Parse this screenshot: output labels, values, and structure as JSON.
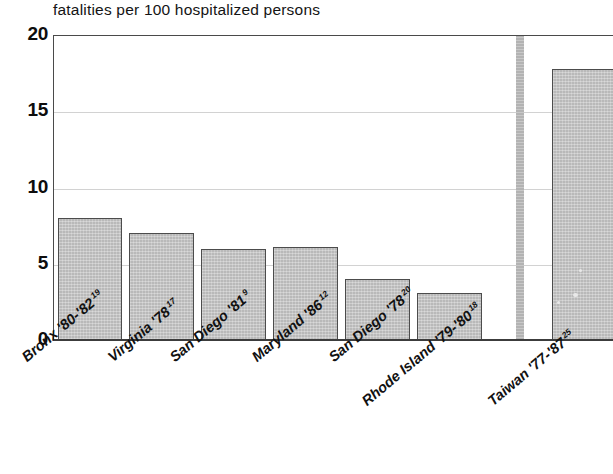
{
  "chart_data": {
    "type": "bar",
    "title": "fatalities per 100 hospitalized persons",
    "xlabel": "",
    "ylabel": "",
    "ylim": [
      0,
      20
    ],
    "yticks": [
      "0",
      "5",
      "10",
      "15",
      "20"
    ],
    "ytick_values": [
      0,
      5,
      10,
      15,
      20
    ],
    "grid": "horizontal",
    "legend": "none",
    "categories": [
      "Bronx '80-'82",
      "Virginia '78",
      "San Diego '81",
      "Maryland '86",
      "San Diego '78",
      "Rhode Island '79-'80",
      "Taiwan '77-'87"
    ],
    "reference_marks": [
      "19",
      "17",
      "9",
      "12",
      "20",
      "18",
      "25"
    ],
    "values": [
      8.0,
      7.0,
      6.0,
      6.1,
      4.0,
      3.1,
      17.8
    ],
    "bar_color": "#b9b9b9",
    "bar_edge_color": "#4c4c4c",
    "separator_note": "vertical gray band separating the last category from the rest"
  },
  "bars": [
    {
      "label": "Bronx '80-'82",
      "ref": "19",
      "value": 8.0,
      "x": 57,
      "w": 64
    },
    {
      "label": "Virginia '78",
      "ref": "17",
      "value": 7.0,
      "x": 128,
      "w": 65
    },
    {
      "label": "San Diego '81",
      "ref": "9",
      "value": 6.0,
      "x": 200,
      "w": 65
    },
    {
      "label": "Maryland '86",
      "ref": "12",
      "value": 6.1,
      "x": 272,
      "w": 65
    },
    {
      "label": "San Diego '78",
      "ref": "20",
      "value": 4.0,
      "x": 344,
      "w": 65
    },
    {
      "label": "Rhode Island '79-'80",
      "ref": "18",
      "value": 3.1,
      "x": 416,
      "w": 65
    },
    {
      "label": "Taiwan '77-'87",
      "ref": "25",
      "value": 17.8,
      "x": 551,
      "w": 62
    }
  ],
  "yticks": [
    {
      "label": "20",
      "value": 20
    },
    {
      "label": "15",
      "value": 15
    },
    {
      "label": "10",
      "value": 10
    },
    {
      "label": "5",
      "value": 5
    },
    {
      "label": "0",
      "value": 0
    }
  ],
  "xlabels": [
    {
      "text": "Bronx '80-'82",
      "ref": "19",
      "x": 18,
      "y": 352
    },
    {
      "text": "Virginia '78",
      "ref": "17",
      "x": 104,
      "y": 352
    },
    {
      "text": "San Diego '81",
      "ref": "9",
      "x": 166,
      "y": 352
    },
    {
      "text": "Maryland '86",
      "ref": "12",
      "x": 248,
      "y": 352
    },
    {
      "text": "San Diego '78",
      "ref": "20",
      "x": 325,
      "y": 352
    },
    {
      "text": "Rhode Island '79-'80",
      "ref": "18",
      "x": 358,
      "y": 396
    },
    {
      "text": "Taiwan '77-'87",
      "ref": "25",
      "x": 484,
      "y": 396
    }
  ]
}
